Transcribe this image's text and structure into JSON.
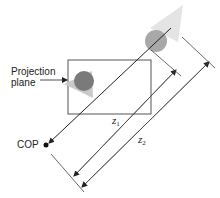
{
  "labels": {
    "projection_plane_line1": "Projection",
    "projection_plane_line2": "plane",
    "cop": "COP",
    "z1_var": "z",
    "z1_sub": "1",
    "z2_var": "z",
    "z2_sub": "2"
  },
  "colors": {
    "line": "#222222",
    "near_circle": "#7a7a7a",
    "far_circle": "#a8a8a8",
    "near_triangle": "#c9c9c9",
    "far_triangle": "#e4e4e4",
    "plane_border": "#555555"
  }
}
